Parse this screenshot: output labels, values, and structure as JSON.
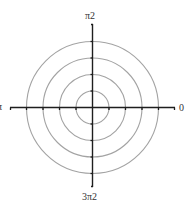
{
  "diagram": {
    "type": "polar-grid",
    "center": {
      "x": 92.5,
      "y": 107.5
    },
    "ring_radii": [
      16.5,
      33,
      49.5,
      66
    ],
    "ring_color": "#a3a3a3",
    "axis_color": "#1e1e1e",
    "axis_extent": {
      "left": 10,
      "right": 175,
      "top": 24,
      "bottom": 187
    },
    "labels": {
      "top": "π2",
      "bottom": "3π2",
      "left": "π",
      "right": "0"
    }
  }
}
